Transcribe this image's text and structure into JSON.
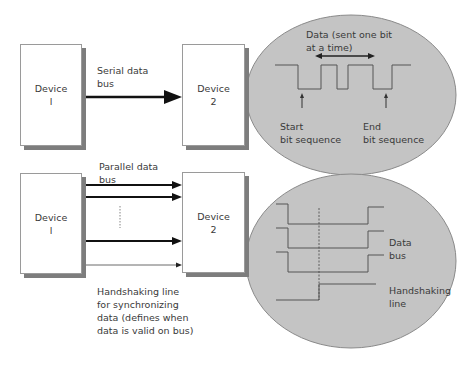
{
  "serial": {
    "device_1": "Device\nl",
    "device_2": "Device\n2",
    "bus_label": "Serial data\nbus",
    "data_label": "Data (sent one bit\nat a time)",
    "start_label": "Start\nbit sequence",
    "end_label": "End\nbit sequence"
  },
  "parallel": {
    "device_1": "Device\nl",
    "device_2": "Device\n2",
    "bus_label": "Parallel data\nbus",
    "handshake_caption": "Handshaking line\nfor synchronizing\ndata (defines when\ndata is valid on bus)",
    "data_bus_label": "Data\nbus",
    "handshake_label": "Handshaking\nline"
  },
  "colors": {
    "ellipse_fill": "#c4c4c4",
    "ellipse_stroke": "#8a8a8a",
    "line": "#444444",
    "shadow": "#7d7d7d"
  }
}
